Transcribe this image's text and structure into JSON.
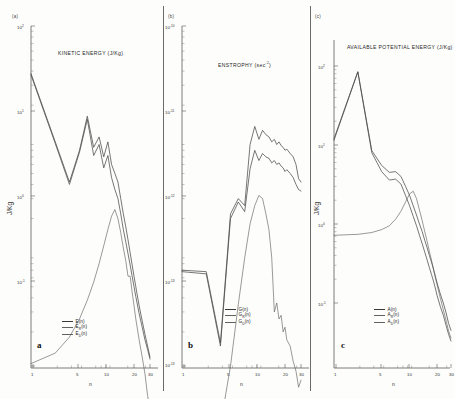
{
  "figure": {
    "panels": [
      {
        "key": "a",
        "marker": "(a)",
        "letter": "a",
        "title": "KINETIC ENERGY (J/Kg)",
        "ylabel": "J/Kg",
        "xlabel": "n",
        "yticks": [
          "10",
          "10",
          "10",
          "10"
        ],
        "yexps": [
          "2",
          "1",
          "0",
          "-1"
        ],
        "xticks": [
          "1",
          "5",
          "10",
          "20",
          "30"
        ],
        "legend": [
          {
            "label": "E(n)",
            "base": "E",
            "sub": "",
            "tail": "(n)"
          },
          {
            "label": "E_R(n)",
            "base": "E",
            "sub": "R",
            "tail": "(n)"
          },
          {
            "label": "E_D(n)",
            "base": "E",
            "sub": "D",
            "tail": "(n)"
          }
        ]
      },
      {
        "key": "b",
        "marker": "(b)",
        "letter": "b",
        "title": "ENSTROPHY (sec",
        "title_exp": "-2",
        "title_tail": ")",
        "ylabel": "",
        "xlabel": "n",
        "yticks": [
          "10",
          "10",
          "10",
          "10"
        ],
        "yexps": [
          "-10",
          "-11",
          "-12",
          "-13"
        ],
        "xticks": [
          "1",
          "5",
          "10",
          "20",
          "30"
        ],
        "legend": [
          {
            "label": "G(n)",
            "base": "G",
            "sub": "",
            "tail": "(n)"
          },
          {
            "label": "G_R(n)",
            "base": "G",
            "sub": "R",
            "tail": "(n)"
          },
          {
            "label": "G_D(n)",
            "base": "G",
            "sub": "D",
            "tail": "(n)"
          }
        ]
      },
      {
        "key": "c",
        "marker": "(c)",
        "letter": "c",
        "title": "AVAILABLE POTENTIAL ENERGY (J/Kg)",
        "ylabel": "J/Kg",
        "xlabel": "n",
        "yticks": [
          "10",
          "10",
          "10",
          "10"
        ],
        "yexps": [
          "2",
          "1",
          "0",
          "-1"
        ],
        "xticks": [
          "1",
          "5",
          "10",
          "20",
          "30"
        ],
        "legend": [
          {
            "label": "A(n)",
            "base": "A",
            "sub": "",
            "tail": "(n)"
          },
          {
            "label": "A_R(n)",
            "base": "A",
            "sub": "R",
            "tail": "(n)"
          },
          {
            "label": "A_D(n)",
            "base": "A",
            "sub": "D",
            "tail": "(n)"
          }
        ]
      }
    ]
  },
  "chart_data": [
    {
      "type": "line",
      "panel": "a",
      "title": "KINETIC ENERGY (J/Kg)",
      "xlabel": "n",
      "ylabel": "J/Kg",
      "xscale": "log",
      "yscale": "log",
      "xlim": [
        1,
        30
      ],
      "ylim": [
        0.1,
        100
      ],
      "xticks": [
        1,
        5,
        10,
        20,
        30
      ],
      "yticks": [
        0.1,
        1,
        10,
        100
      ],
      "grid": false,
      "legend_position": "bottom-left",
      "x": [
        1,
        2,
        3,
        4,
        5,
        6,
        7,
        8,
        9,
        10,
        11,
        12,
        13,
        14,
        15,
        16,
        17,
        18,
        19,
        20,
        22,
        24,
        26,
        28,
        30
      ],
      "series": [
        {
          "name": "E(n)",
          "values": [
            38,
            9.5,
            4.2,
            8.0,
            16.0,
            8.5,
            10.5,
            7.0,
            9.5,
            6.0,
            5.0,
            4.2,
            3.0,
            2.2,
            1.7,
            1.3,
            1.0,
            0.78,
            0.62,
            0.5,
            0.34,
            0.25,
            0.19,
            0.15,
            0.12
          ]
        },
        {
          "name": "E_R(n)",
          "values": [
            37,
            9.2,
            4.0,
            7.7,
            15.0,
            7.2,
            9.0,
            5.6,
            7.2,
            4.6,
            3.6,
            3.0,
            2.2,
            1.6,
            1.25,
            0.98,
            0.78,
            0.62,
            0.5,
            0.41,
            0.29,
            0.22,
            0.17,
            0.14,
            0.115
          ]
        },
        {
          "name": "E_D(n)",
          "values": [
            0.105,
            0.13,
            0.18,
            0.26,
            0.38,
            0.55,
            0.8,
            1.15,
            1.6,
            2.1,
            2.4,
            2.0,
            1.5,
            1.1,
            0.85,
            0.62,
            0.62,
            0.45,
            0.34,
            0.26,
            0.17,
            0.12,
            0.085,
            0.055,
            0.042
          ]
        }
      ]
    },
    {
      "type": "line",
      "panel": "b",
      "title": "ENSTROPHY (sec^-2)",
      "xlabel": "n",
      "ylabel": "",
      "xscale": "log",
      "yscale": "log",
      "xlim": [
        1,
        30
      ],
      "ylim": [
        1e-13,
        1e-10
      ],
      "xticks": [
        1,
        5,
        10,
        20,
        30
      ],
      "yticks": [
        1e-13,
        1e-12,
        1e-11,
        1e-10
      ],
      "grid": false,
      "legend_position": "bottom-center",
      "x": [
        1,
        2,
        3,
        4,
        5,
        6,
        7,
        8,
        9,
        10,
        11,
        12,
        13,
        14,
        15,
        16,
        17,
        18,
        19,
        20,
        22,
        24,
        26,
        28,
        30
      ],
      "series": [
        {
          "name": "G(n)",
          "values": [
            7e-13,
            6.8e-13,
            1.6e-13,
            2.2e-12,
            3e-12,
            2.6e-12,
            9e-12,
            1.3e-11,
            1e-11,
            1.2e-11,
            1.1e-11,
            1.05e-11,
            9.5e-12,
            1e-11,
            9e-12,
            9.5e-12,
            8.8e-12,
            8.5e-12,
            8e-12,
            8.2e-12,
            7.5e-12,
            7e-12,
            6e-12,
            4.5e-12,
            4.2e-12
          ]
        },
        {
          "name": "G_R(n)",
          "values": [
            6.8e-13,
            6.5e-13,
            1.5e-13,
            2e-12,
            2.8e-12,
            2.3e-12,
            5.5e-12,
            8e-12,
            6.5e-12,
            7.5e-12,
            7e-12,
            6.8e-12,
            6.2e-12,
            6.5e-12,
            6e-12,
            6.2e-12,
            5.8e-12,
            5.6e-12,
            5.2e-12,
            5.4e-12,
            5e-12,
            4.6e-12,
            4e-12,
            3.6e-12,
            3.5e-12
          ]
        },
        {
          "name": "G_D(n)",
          "values": [
            2e-15,
            8e-15,
            3e-14,
            1e-13,
            3.5e-13,
            9e-13,
            1.8e-12,
            2.6e-12,
            3.2e-12,
            3e-12,
            2.2e-12,
            1.6e-12,
            9e-13,
            3e-13,
            3.6e-13,
            2.6e-13,
            2.8e-13,
            2e-13,
            2.2e-13,
            1.7e-13,
            1.5e-13,
            1.1e-13,
            9e-14,
            6.5e-14,
            7.5e-14
          ]
        }
      ]
    },
    {
      "type": "line",
      "panel": "c",
      "title": "AVAILABLE POTENTIAL ENERGY (J/Kg)",
      "xlabel": "n",
      "ylabel": "J/Kg",
      "xscale": "log",
      "yscale": "log",
      "xlim": [
        1,
        30
      ],
      "ylim": [
        0.1,
        100
      ],
      "xticks": [
        1,
        5,
        10,
        20,
        30
      ],
      "yticks": [
        0.1,
        1,
        10,
        100
      ],
      "grid": false,
      "legend_position": "bottom-center",
      "x": [
        1,
        2,
        3,
        4,
        5,
        6,
        7,
        8,
        9,
        10,
        11,
        12,
        13,
        14,
        15,
        16,
        17,
        18,
        19,
        20,
        22,
        24,
        26,
        28,
        30
      ],
      "series": [
        {
          "name": "A(n)",
          "values": [
            12,
            85,
            8.5,
            5.5,
            4.5,
            4.6,
            4.0,
            3.0,
            2.3,
            1.7,
            1.3,
            1.0,
            0.8,
            0.62,
            0.5,
            0.4,
            0.33,
            0.27,
            0.22,
            0.18,
            0.13,
            0.1,
            0.075,
            0.055,
            0.045
          ]
        },
        {
          "name": "A_R(n)",
          "values": [
            11.5,
            84,
            8.0,
            4.6,
            3.6,
            3.7,
            3.2,
            2.3,
            1.7,
            1.25,
            0.95,
            0.72,
            0.56,
            0.44,
            0.35,
            0.28,
            0.23,
            0.19,
            0.155,
            0.125,
            0.09,
            0.07,
            0.052,
            0.04,
            0.033
          ]
        },
        {
          "name": "A_D(n)",
          "values": [
            0.72,
            0.74,
            0.78,
            0.85,
            0.95,
            1.15,
            1.45,
            1.9,
            2.4,
            2.6,
            2.1,
            1.5,
            1.1,
            0.8,
            0.6,
            0.45,
            0.35,
            0.27,
            0.21,
            0.17,
            0.115,
            0.082,
            0.06,
            0.044,
            0.036
          ]
        }
      ]
    }
  ]
}
